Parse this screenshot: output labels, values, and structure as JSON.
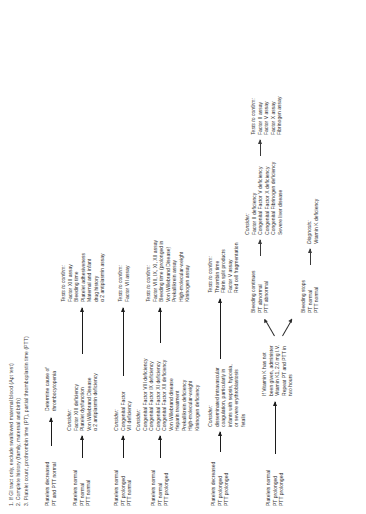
{
  "header": {
    "notes": [
      "1. If GI tract only, exclude swallowed maternal blood (Apt test)",
      "2. Complete history (family, maternal and birth)",
      "3. Platelet count, prothrombin time (PT), partial thromboplastin time (PTT)"
    ]
  },
  "branches": {
    "b1": {
      "test": [
        "Platelets decreased",
        "PT and PTT normal"
      ],
      "result": [
        "Determine cause of",
        "thrombocytopenia"
      ]
    },
    "b2": {
      "test": [
        "Platelets normal",
        "PT normal",
        "PTT normal"
      ],
      "consider_title": "Consider:",
      "consider": [
        "Factor XIII deficiency",
        "Platelet dysfunction",
        "Von Willebrand Disease",
        "α 2 antiplasmin deficiency"
      ],
      "confirm_title": "Tests to confirm:",
      "confirm": [
        "Factor XIII assay",
        "Bleeding time",
        "Platelet adhesiveness",
        "Maternal and infant",
        "drug history",
        "α 2 antiplasmin assay"
      ]
    },
    "b3": {
      "test": [
        "Platelets normal",
        "PT prolonged",
        "PTT normal"
      ],
      "consider_title": "Consider:",
      "consider": [
        "Congenital Factor",
        "VII deficiency"
      ],
      "confirm_title": "Tests to confirm:",
      "confirm": [
        "Factor VII assay"
      ]
    },
    "b4": {
      "test": [
        "Platelets normal",
        "PT normal",
        "PTT prolonged"
      ],
      "consider_title": "Consider:",
      "consider": [
        "Congenital Factor VIII deficiency",
        "Congenital Factor IX deficiency",
        "Congenital Factor XI deficiency",
        "Congenital Factor XII deficiency",
        "Von Willebrand disease",
        "Heparin treatment",
        "Prekallikrein deficiency",
        "High-molecular-weight",
        "Kininogen deficiency"
      ],
      "confirm_title": "Tests to confirm:",
      "confirm": [
        "Factor VIII, IX, XI, XII assay",
        "Bleeding time (prolonged in",
        "Von Willebrand Disease)",
        "Prekallikrein assay",
        "High-molecular-weight",
        "Kininogen assay"
      ]
    },
    "b5": {
      "test": [
        "Platelets decreased",
        "PT prolonged",
        "PTT prolonged"
      ],
      "consider_title": "Consider:",
      "consider": [
        "disseminated intravascular",
        "coagulation, particularly in",
        "infants with sepsis, hypoxia,",
        "or severe erythroblastosis",
        "fetalis"
      ],
      "confirm_title": "Tests to confirm:",
      "confirm": [
        "Thrombin time",
        "Fibrin split products",
        "Factor V assay",
        "Red cell fragmentation"
      ]
    },
    "b6": {
      "test": [
        "Platelets normal",
        "PT prolonged",
        "PTT prolonged"
      ],
      "action": [
        "If Vitamin K has not",
        "been given, administer",
        "Vitamin K1, 2.0 mg I.V.",
        "Repeat PT and PTT in",
        "two hours"
      ],
      "outcome_stop": [
        "Bleeding stops",
        "PT normal",
        "PTT normal"
      ],
      "diagnosis": [
        "Diagnosis:",
        "Vitamin K deficiency"
      ],
      "outcome_continue": [
        "Bleeding continues",
        "PT abnormal",
        "PTT abnormal"
      ],
      "consider_title": "Consider:",
      "consider": [
        "Factor II deficiency",
        "Congenital Factor V deficiency",
        "Congenital Factor X deficiency",
        "Congenital Fibrinogen deficiency",
        "Severe liver disease"
      ],
      "confirm_title": "Tests to confirm:",
      "confirm": [
        "Factor II assay",
        "Factor V assay",
        "Factor X assay",
        "Fibrinogen assay"
      ]
    }
  }
}
